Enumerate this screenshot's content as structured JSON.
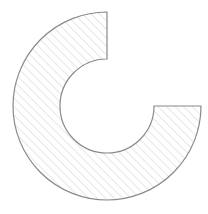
{
  "diagram": {
    "shape": "annulus-sector",
    "center": [
      107,
      106
    ],
    "outer_radius": 94,
    "inner_radius": 47,
    "start_angle_deg": -90,
    "end_angle_deg": 180,
    "stroke_color": "#8a8a8a",
    "hatch_color": "#d6d6d6",
    "fill_color": "#ffffff"
  }
}
